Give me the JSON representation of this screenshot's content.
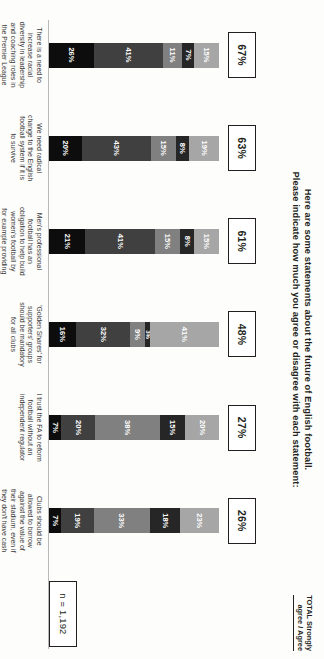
{
  "chart_data": {
    "type": "bar",
    "subtype": "100% stacked horizontal bar",
    "title": "Here are some statements about the future of English football.\nPlease indicate how much you agree or disagree with each statement:",
    "title_line1": "Here are some statements about the future of English football.",
    "title_line2": "Please indicate how much you agree or disagree with each statement:",
    "xlabel": "",
    "ylabel": "",
    "ylim": [
      0,
      100
    ],
    "grid": false,
    "legend_position": "bottom",
    "legend": [
      "Strongly agree",
      "Agree",
      "Disagree",
      "Strongly disagree",
      "Don't know"
    ],
    "series": [
      {
        "name": "Strongly agree",
        "color": "#0d0d0d",
        "values": [
          26,
          20,
          21,
          16,
          7,
          7
        ]
      },
      {
        "name": "Agree",
        "color": "#404040",
        "values": [
          41,
          43,
          41,
          32,
          20,
          19
        ]
      },
      {
        "name": "Disagree",
        "color": "#808080",
        "values": [
          11,
          15,
          15,
          9,
          38,
          33
        ]
      },
      {
        "name": "Strongly disagree",
        "color": "#262626",
        "values": [
          7,
          8,
          8,
          3,
          15,
          18
        ]
      },
      {
        "name": "Don't know",
        "color": "#a6a6a6",
        "values": [
          15,
          19,
          15,
          41,
          20,
          23
        ]
      }
    ],
    "categories": [
      "There is a need to increase racial diversity in leadership and coaching roles in the Premier League",
      "We need radical change to the English football system if it is to survive",
      "Men's professional football has an obligation to help build women's football by for example providing financial support",
      "'Golden Shares' for supporters' groups should be mandatory for all clubs",
      "I trust the FA to reform football without an independent regulator",
      "Clubs should be allowed to borrow against the value of their stadium, even if they don't have cash or a bank guarantee in place"
    ],
    "annotations": {
      "total_header_line1": "TOTAL Strongly",
      "total_header_line2": "agree / Agree",
      "totals": [
        "67%",
        "63%",
        "61%",
        "48%",
        "27%",
        "26%"
      ],
      "base": "n = 1,192"
    }
  },
  "bars": [
    {
      "total": "67%",
      "category": "There is a need to increase racial diversity in leadership and coaching roles in the Premier League",
      "segments": [
        {
          "key": "dk",
          "label": "15%",
          "value": 15
        },
        {
          "key": "sd",
          "label": "7%",
          "value": 7
        },
        {
          "key": "d",
          "label": "11%",
          "value": 11
        },
        {
          "key": "a",
          "label": "41%",
          "value": 41
        },
        {
          "key": "sa",
          "label": "26%",
          "value": 26
        }
      ]
    },
    {
      "total": "63%",
      "category": "We need radical change to the English football system if it is to survive",
      "segments": [
        {
          "key": "dk",
          "label": "19%",
          "value": 19
        },
        {
          "key": "sd",
          "label": "8%",
          "value": 8
        },
        {
          "key": "d",
          "label": "15%",
          "value": 15
        },
        {
          "key": "a",
          "label": "43%",
          "value": 43
        },
        {
          "key": "sa",
          "label": "20%",
          "value": 20
        }
      ]
    },
    {
      "total": "61%",
      "category": "Men's professional football has an obligation to help build women's football by for example providing financial support",
      "segments": [
        {
          "key": "dk",
          "label": "15%",
          "value": 15
        },
        {
          "key": "sd",
          "label": "8%",
          "value": 8
        },
        {
          "key": "d",
          "label": "15%",
          "value": 15
        },
        {
          "key": "a",
          "label": "41%",
          "value": 41
        },
        {
          "key": "sa",
          "label": "21%",
          "value": 21
        }
      ]
    },
    {
      "total": "48%",
      "category": "'Golden Shares' for supporters' groups should be mandatory for all clubs",
      "segments": [
        {
          "key": "dk",
          "label": "41%",
          "value": 41
        },
        {
          "key": "sd",
          "label": "3%",
          "value": 3
        },
        {
          "key": "d",
          "label": "9%",
          "value": 9
        },
        {
          "key": "a",
          "label": "32%",
          "value": 32
        },
        {
          "key": "sa",
          "label": "16%",
          "value": 16
        }
      ]
    },
    {
      "total": "27%",
      "category": "I trust the FA to reform football without an independent regulator",
      "segments": [
        {
          "key": "dk",
          "label": "20%",
          "value": 20
        },
        {
          "key": "sd",
          "label": "15%",
          "value": 15
        },
        {
          "key": "d",
          "label": "38%",
          "value": 38
        },
        {
          "key": "a",
          "label": "20%",
          "value": 20
        },
        {
          "key": "sa",
          "label": "7%",
          "value": 7
        }
      ]
    },
    {
      "total": "26%",
      "category": "Clubs should be allowed to borrow against the value of their stadium, even if they don't have cash or a bank guarantee in place",
      "segments": [
        {
          "key": "dk",
          "label": "23%",
          "value": 23
        },
        {
          "key": "sd",
          "label": "18%",
          "value": 18
        },
        {
          "key": "d",
          "label": "33%",
          "value": 33
        },
        {
          "key": "a",
          "label": "19%",
          "value": 19
        },
        {
          "key": "sa",
          "label": "7%",
          "value": 7
        }
      ]
    }
  ],
  "total_header": {
    "line1": "TOTAL Strongly",
    "line2": "agree / Agree"
  },
  "base_note": "n = 1,192",
  "legend": [
    {
      "key": "sa",
      "label": "Strongly agree"
    },
    {
      "key": "a",
      "label": "Agree"
    },
    {
      "key": "d",
      "label": "Disagree"
    },
    {
      "key": "sd",
      "label": "Strongly disagree"
    },
    {
      "key": "dk",
      "label": "Don't know"
    }
  ]
}
